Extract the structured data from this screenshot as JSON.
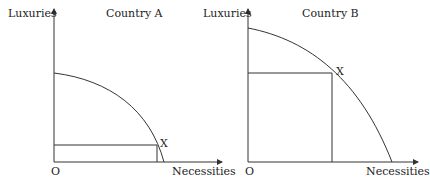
{
  "panels": [
    {
      "title": "Country A",
      "y_axis_label": "Luxuries",
      "x_axis_label": "Necessities",
      "origin_label": "O",
      "point_label": "X",
      "description": "Production possibility frontier with point X near the necessities axis (mostly necessities, few luxuries)"
    },
    {
      "title": "Country B",
      "y_axis_label": "Luxuries",
      "x_axis_label": "Necessities",
      "origin_label": "O",
      "point_label": "X",
      "description": "Production possibility frontier with point X in the middle (balanced mix of luxuries and necessities)"
    }
  ],
  "colors": {
    "line": "#333333",
    "text": "#222222"
  }
}
